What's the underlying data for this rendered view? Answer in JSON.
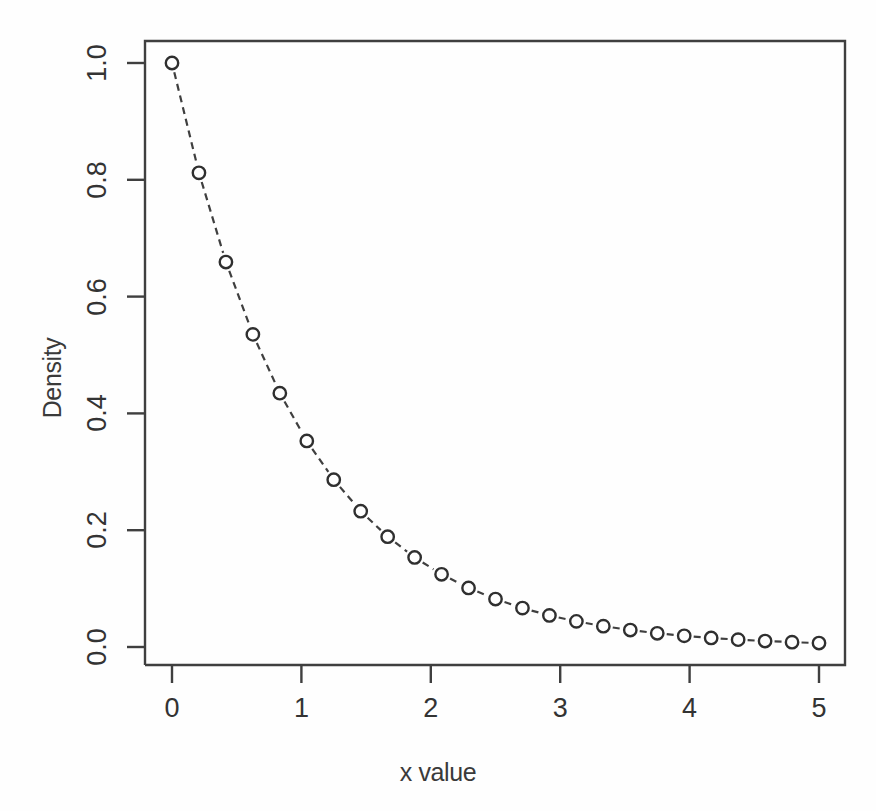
{
  "figure": {
    "background_color": "#fefefe",
    "plot_box": {
      "left": 145,
      "top": 41,
      "right": 845,
      "bottom": 665
    },
    "stroke_color": "#3f3f3f",
    "point_color": "#2f2f2f"
  },
  "chart_data": {
    "type": "line",
    "title": "",
    "subtitle": "",
    "xlabel": "x value",
    "ylabel": "Density",
    "xlim": [
      0,
      5
    ],
    "ylim": [
      0,
      1
    ],
    "xticks": [
      0,
      1,
      2,
      3,
      4,
      5
    ],
    "xtick_labels": [
      "0",
      "1",
      "2",
      "3",
      "4",
      "5"
    ],
    "yticks": [
      0.0,
      0.2,
      0.4,
      0.6,
      0.8,
      1.0
    ],
    "ytick_labels": [
      "0.0",
      "0.2",
      "0.4",
      "0.6",
      "0.8",
      "1.0"
    ],
    "grid": false,
    "legend": null,
    "legend_position": "none",
    "marker": "open-circle",
    "line_style": "dashed",
    "series": [
      {
        "name": "Exponential density (rate = 1)",
        "x": [
          0.0,
          0.2083,
          0.4167,
          0.625,
          0.8333,
          1.0417,
          1.25,
          1.4583,
          1.6667,
          1.875,
          2.0833,
          2.2917,
          2.5,
          2.7083,
          2.9167,
          3.125,
          3.3333,
          3.5417,
          3.75,
          3.9583,
          4.1667,
          4.375,
          4.5833,
          4.7917,
          5.0
        ],
        "values": [
          1.0,
          0.8119,
          0.6592,
          0.5353,
          0.4346,
          0.3528,
          0.2865,
          0.2326,
          0.1889,
          0.1534,
          0.1245,
          0.1011,
          0.0821,
          0.0666,
          0.0541,
          0.0439,
          0.0357,
          0.029,
          0.0235,
          0.0191,
          0.0155,
          0.0126,
          0.0102,
          0.0083,
          0.0067
        ]
      }
    ]
  }
}
